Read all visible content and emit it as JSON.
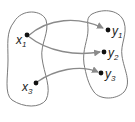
{
  "diagram": {
    "type": "function-mapping",
    "domain_set": {
      "points": [
        {
          "id": "x1",
          "base": "x",
          "sub": "1"
        },
        {
          "id": "x3",
          "base": "x",
          "sub": "3"
        }
      ]
    },
    "codomain_set": {
      "points": [
        {
          "id": "y1",
          "base": "y",
          "sub": "1"
        },
        {
          "id": "y2",
          "base": "y",
          "sub": "2"
        },
        {
          "id": "y3",
          "base": "y",
          "sub": "3"
        }
      ]
    },
    "mappings": [
      {
        "from": "x1",
        "to": "y1"
      },
      {
        "from": "x1",
        "to": "y2"
      },
      {
        "from": "x3",
        "to": "y3"
      }
    ],
    "colors": {
      "outline": "#7a7a7a",
      "arrow": "#8a8a8a",
      "point": "#111111"
    }
  }
}
